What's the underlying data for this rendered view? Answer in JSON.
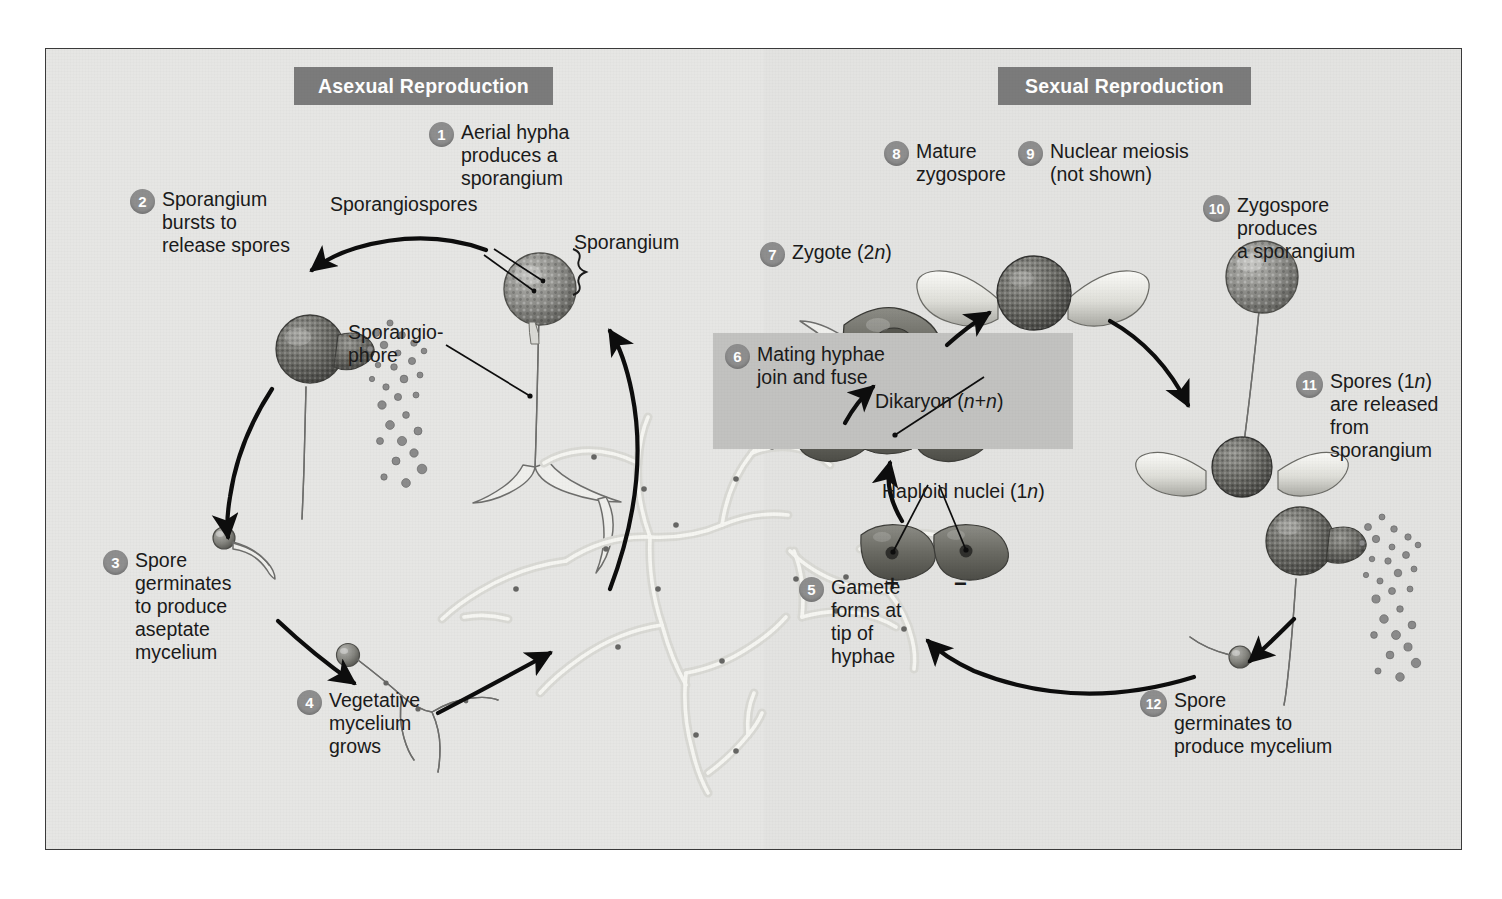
{
  "figure": {
    "frame_color": "#3a3a3a",
    "background_color": "#e6e6e4",
    "banner_color": "#7b7b7b",
    "step_circle_color": "#8e8e8e",
    "inset_box_color": "#c2c2c0"
  },
  "banners": {
    "asexual": "Asexual Reproduction",
    "sexual": "Sexual Reproduction"
  },
  "steps": [
    {
      "num": "1",
      "text": "Aerial hypha\nproduces a\nsporangium"
    },
    {
      "num": "2",
      "text": "Sporangium\nbursts to\nrelease spores"
    },
    {
      "num": "3",
      "text": "Spore\ngerminates\nto produce\naseptate\nmycelium"
    },
    {
      "num": "4",
      "text": "Vegetative\nmycelium\ngrows"
    },
    {
      "num": "5",
      "text": "Gamete\nforms at\ntip of\nhyphae"
    },
    {
      "num": "6",
      "text": "Mating hyphae\njoin and fuse"
    },
    {
      "num": "7",
      "text": "Zygote (2n)"
    },
    {
      "num": "8",
      "text": "Mature\nzygospore"
    },
    {
      "num": "9",
      "text": "Nuclear meiosis\n(not shown)"
    },
    {
      "num": "10",
      "text": "Zygospore\nproduces\na sporangium"
    },
    {
      "num": "11",
      "text": "Spores (1n)\nare released\nfrom\nsporangium"
    },
    {
      "num": "12",
      "text": "Spore\ngerminates to\nproduce mycelium"
    }
  ],
  "labels": {
    "sporangiospores": "Sporangiospores",
    "sporangium": "Sporangium",
    "sporangiophore": "Sporangio-\nphore",
    "dikaryon": "Dikaryon (n+n)",
    "haploid_nuclei": "Haploid nuclei (1n)",
    "plus_sign": "+",
    "minus_sign": "−"
  }
}
